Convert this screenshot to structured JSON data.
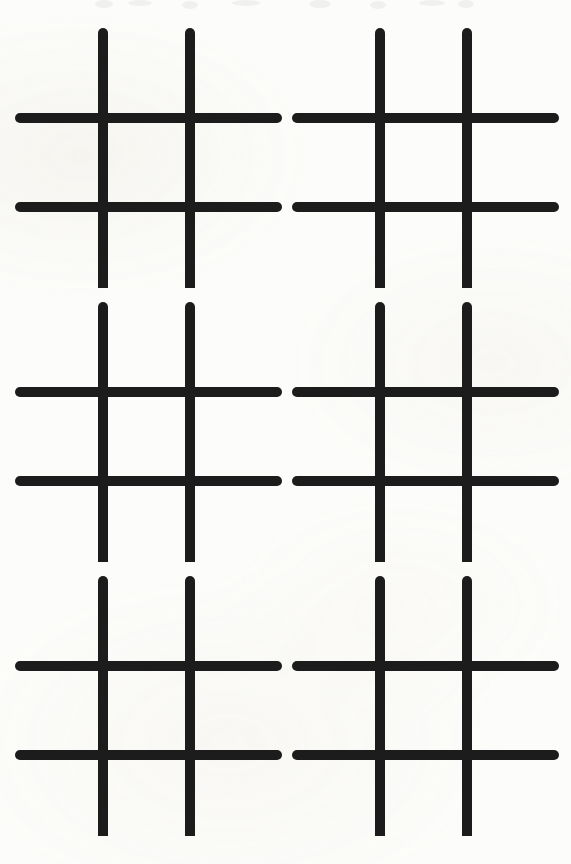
{
  "page": {
    "width": 571,
    "height": 864,
    "background_color": "#fcfcfa",
    "ink_color": "#1c1c1c",
    "ghost_color": "#3a3a3a"
  },
  "sheet": {
    "layout": {
      "columns": 2,
      "rows": 3,
      "total_blocks": 6,
      "block_width": 285.5,
      "block_height": 288,
      "row_tops": [
        0,
        274,
        548
      ]
    },
    "stroke": {
      "width": 10,
      "linecap": "round",
      "color": "#1c1c1c"
    },
    "block_geometry": {
      "vertical_x": [
        103,
        190
      ],
      "vertical_y_start": 33,
      "vertical_y_end": 294,
      "horizontal_y": [
        118,
        207
      ],
      "horizontal_x_start": 20,
      "horizontal_x_end": 277
    },
    "blocks": [
      {
        "id": "grid-1",
        "label": "Grid 1",
        "row": 1,
        "column": 1,
        "left": 0,
        "top": 0,
        "state": "empty",
        "marks": []
      },
      {
        "id": "grid-2",
        "label": "Grid 2",
        "row": 1,
        "column": 2,
        "left": 277,
        "top": 0,
        "state": "empty",
        "marks": []
      },
      {
        "id": "grid-3",
        "label": "Grid 3",
        "row": 2,
        "column": 1,
        "left": 0,
        "top": 274,
        "state": "empty",
        "marks": []
      },
      {
        "id": "grid-4",
        "label": "Grid 4",
        "row": 2,
        "column": 2,
        "left": 277,
        "top": 274,
        "state": "empty",
        "marks": []
      },
      {
        "id": "grid-5",
        "label": "Grid 5",
        "row": 3,
        "column": 1,
        "left": 0,
        "top": 548,
        "state": "empty",
        "marks": []
      },
      {
        "id": "grid-6",
        "label": "Grid 6",
        "row": 3,
        "column": 2,
        "left": 277,
        "top": 548,
        "state": "empty",
        "marks": []
      }
    ]
  },
  "bleed_through": {
    "present": true,
    "note": "Very faint ink ghosting from the reverse side visible along the top edge.",
    "blobs": [
      {
        "cx": 104,
        "cy": 4,
        "rx": 9,
        "ry": 4
      },
      {
        "cx": 140,
        "cy": 3,
        "rx": 12,
        "ry": 3
      },
      {
        "cx": 190,
        "cy": 5,
        "rx": 8,
        "ry": 4
      },
      {
        "cx": 246,
        "cy": 3,
        "rx": 14,
        "ry": 3
      },
      {
        "cx": 320,
        "cy": 4,
        "rx": 11,
        "ry": 4
      },
      {
        "cx": 378,
        "cy": 5,
        "rx": 8,
        "ry": 4
      },
      {
        "cx": 432,
        "cy": 3,
        "rx": 13,
        "ry": 3
      },
      {
        "cx": 466,
        "cy": 4,
        "rx": 8,
        "ry": 4
      }
    ]
  }
}
